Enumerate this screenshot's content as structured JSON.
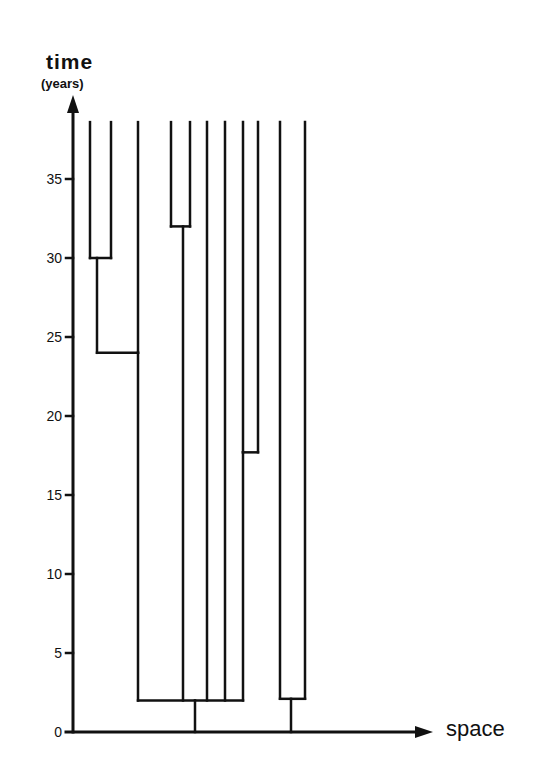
{
  "axes": {
    "y_title": "time",
    "y_units": "(years)",
    "x_title": "space",
    "y_ticks": [
      0,
      5,
      10,
      15,
      20,
      25,
      30,
      35
    ],
    "y_range": [
      0,
      38.6
    ]
  },
  "style": {
    "line_color": "#111111",
    "background": "#ffffff"
  },
  "chart_data": {
    "type": "tree",
    "title": "",
    "xlabel": "space",
    "ylabel": "time (years)",
    "ylim": [
      0,
      38.6
    ],
    "y_ticks": [
      0,
      5,
      10,
      15,
      20,
      25,
      30,
      35
    ],
    "lineage_top_time": 38.6,
    "lineages_x": [
      90,
      111,
      138,
      171,
      190,
      207,
      225,
      243,
      258,
      280,
      305
    ],
    "merges": [
      {
        "children_x": [
          90,
          111
        ],
        "time": 30.0,
        "stem_x": 97
      },
      {
        "children_x": [
          97,
          138
        ],
        "time": 24.0,
        "stem_x": 138
      },
      {
        "children_x": [
          171,
          190
        ],
        "time": 32.0,
        "stem_x": 183
      },
      {
        "children_x": [
          243,
          258
        ],
        "time": 17.7,
        "stem_x": 243
      },
      {
        "children_x": [
          138,
          183,
          207,
          225,
          243
        ],
        "time": 2.0,
        "stem_x": 195
      },
      {
        "children_x": [
          280,
          305
        ],
        "time": 2.1,
        "stem_x": 291
      }
    ]
  }
}
